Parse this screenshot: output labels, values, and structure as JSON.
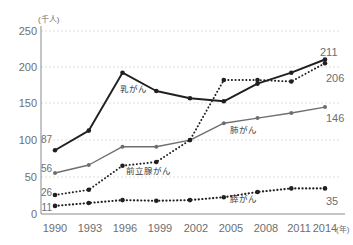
{
  "chart_data": {
    "type": "line",
    "title": "",
    "xlabel": "(年)",
    "ylabel": "(千人)",
    "ylim": [
      0,
      250
    ],
    "yticks": [
      0,
      50,
      100,
      150,
      200,
      250
    ],
    "grid": true,
    "legend_position": "inline-annotations",
    "categories": [
      "1990",
      "1993",
      "1996",
      "1999",
      "2002",
      "2005",
      "2008",
      "2011",
      "2014"
    ],
    "series": [
      {
        "name": "乳がん",
        "style": "solid",
        "color": "#231f20",
        "values": [
          87,
          114,
          193,
          168,
          158,
          154,
          178,
          193,
          211
        ],
        "start_label": "87",
        "end_label": "211"
      },
      {
        "name": "前立腺がん",
        "style": "dotted",
        "color": "#231f20",
        "values": [
          26,
          33,
          66,
          71,
          101,
          183,
          183,
          181,
          206
        ],
        "start_label": "26",
        "end_label": "206"
      },
      {
        "name": "肺がん",
        "style": "solid",
        "color": "#6d6e71",
        "values": [
          56,
          67,
          92,
          92,
          101,
          124,
          131,
          138,
          146
        ],
        "start_label": "56",
        "end_label": "146"
      },
      {
        "name": "膵がん",
        "style": "dotted",
        "color": "#231f20",
        "values": [
          11,
          15,
          19,
          18,
          19,
          23,
          30,
          35,
          35
        ],
        "start_label": "11",
        "end_label": "35"
      }
    ]
  },
  "axis": {
    "unit_y": "(千人)",
    "unit_x": "(年)",
    "yticks": [
      "250",
      "200",
      "150",
      "100",
      "50",
      "0"
    ],
    "xticks": [
      "1990",
      "1993",
      "1996",
      "1999",
      "2002",
      "2005",
      "2008",
      "2011",
      "2014"
    ]
  },
  "annotations": {
    "breast": "乳がん",
    "prostate": "前立腺がん",
    "lung": "肺がん",
    "pancreas": "膵がん"
  },
  "value_labels": {
    "start": [
      "87",
      "56",
      "26",
      "11"
    ],
    "end": [
      "211",
      "206",
      "146",
      "35"
    ]
  }
}
